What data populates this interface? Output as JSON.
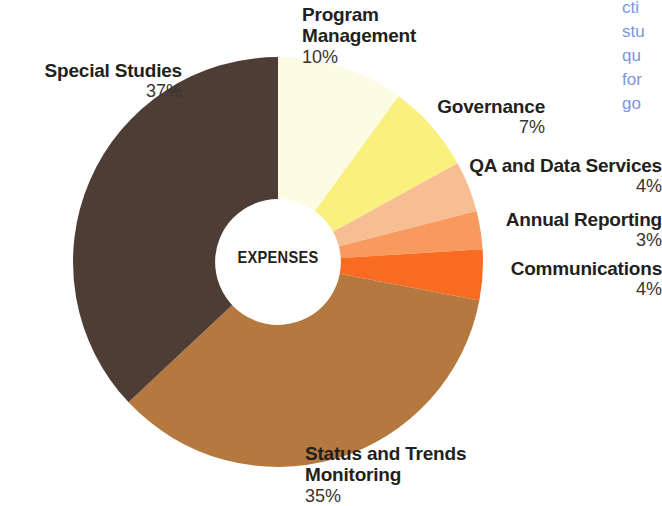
{
  "chart_data": {
    "type": "pie",
    "title": "EXPENSES",
    "subtitle": "",
    "xlabel": "",
    "ylabel": "",
    "donut": true,
    "inner_radius_ratio": 0.307,
    "start_angle_deg": 0,
    "direction": "clockwise",
    "legend_position": "outside-labels",
    "grid": false,
    "value_unit": "%",
    "categories": [
      "Program Management",
      "Governance",
      "QA and Data Services",
      "Annual Reporting",
      "Communications",
      "Status and Trends Monitoring",
      "Special Studies"
    ],
    "values": [
      10,
      7,
      4,
      3,
      4,
      35,
      37
    ],
    "value_labels": [
      "10%",
      "7%",
      "4%",
      "3%",
      "4%",
      "35%",
      "37%"
    ],
    "colors": [
      "#FCFBE3",
      "#FAF07E",
      "#F8BE93",
      "#F89A5E",
      "#F96B20",
      "#B5793F",
      "#4E3D34"
    ],
    "slices": [
      {
        "label": "Program Management",
        "value": 10,
        "value_label": "10%",
        "color": "#FCFBE3"
      },
      {
        "label": "Governance",
        "value": 7,
        "value_label": "7%",
        "color": "#FAF07E"
      },
      {
        "label": "QA and Data Services",
        "value": 4,
        "value_label": "4%",
        "color": "#F8BE93"
      },
      {
        "label": "Annual Reporting",
        "value": 3,
        "value_label": "3%",
        "color": "#F89A5E"
      },
      {
        "label": "Communications",
        "value": 4,
        "value_label": "4%",
        "color": "#F96B20"
      },
      {
        "label": "Status and Trends Monitoring",
        "value": 35,
        "value_label": "35%",
        "color": "#B5793F"
      },
      {
        "label": "Special Studies",
        "value": 37,
        "value_label": "37%",
        "color": "#4E3D34"
      }
    ]
  },
  "center": {
    "caption": "EXPENSES"
  },
  "labels": {
    "program_management": {
      "line1": "Program",
      "line2": "Management",
      "pct": "10%"
    },
    "special_studies": {
      "name": "Special Studies",
      "pct": "37%"
    },
    "governance": {
      "name": "Governance",
      "pct": "7%"
    },
    "qa_data_services": {
      "name": "QA and Data Services",
      "pct": "4%"
    },
    "annual_reporting": {
      "name": "Annual Reporting",
      "pct": "3%"
    },
    "communications": {
      "name": "Communications",
      "pct": "4%"
    },
    "status_trends": {
      "line1": "Status and Trends",
      "line2": "Monitoring",
      "pct": "35%"
    }
  },
  "side_text": {
    "color": "#7d96dd",
    "lines": [
      "cti",
      "stu",
      "qu",
      "for",
      "go"
    ]
  },
  "theme": {
    "background": "#ffffff",
    "text_color": "#231f1c",
    "pct_color": "#3a3430"
  }
}
